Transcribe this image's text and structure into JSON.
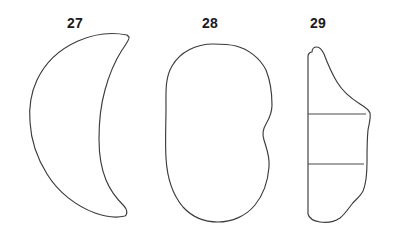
{
  "figure": {
    "type": "archaeological-artifact-line-drawing",
    "background_color": "#ffffff",
    "outline_color": "#3c3c3c",
    "label_color": "#1a1a1a",
    "width": 393,
    "height": 240
  },
  "artifacts": [
    {
      "label": "27",
      "name": "crescent-lunate-artifact",
      "description": "crescent / lunate outline, convex left edge and concave right edge meeting at pointed upper and lower tips",
      "label_x": 75,
      "label_y": 16,
      "outline_path": "M 127 35 C 112 32 94 34 78 41 C 60 49 45 63 37 80 C 30 95 29 110 30 122 C 31 140 37 158 47 174 C 58 192 76 206 95 213 C 106 217 117 218 125 216 C 128 214 127 209 124 206 C 117 199 110 190 106 180 C 101 168 99 154 99 139 C 99 122 101 104 105 90 C 109 75 115 61 122 50 C 126 44 130 39 129 37 Z",
      "cross_lines": []
    },
    {
      "label": "28",
      "name": "kidney-bean-artifact",
      "description": "kidney / bean shaped outline with an S-curve notch indenting the right margin at mid-height",
      "label_x": 210,
      "label_y": 16,
      "outline_path": "M 213 44 C 196 44 180 52 172 66 C 165 78 166 92 166 106 C 166 124 165 142 166 158 C 167 176 172 194 183 207 C 193 218 206 222 218 222 C 232 222 246 216 255 205 C 264 194 268 180 269 167 C 270 156 266 147 264 140 C 262 134 263 129 266 124 C 269 119 272 113 272 105 C 272 93 270 80 266 70 C 260 58 248 49 236 46 C 228 44 220 44 213 44 Z",
      "cross_lines": []
    },
    {
      "label": "29",
      "name": "irregular-slab-artifact",
      "description": "narrow irregular profile with straight vertical left margin, stepped right margin, and two horizontal break lines dividing it into three segments",
      "label_x": 318,
      "label_y": 16,
      "outline_path": "M 312 52 C 312 49 314 47 317 47 C 320 47 322 50 324 54 C 327 62 331 72 337 82 C 343 92 352 99 360 104 C 365 107 369 110 370 113 C 371 118 369 124 368 130 C 367 140 367 152 367 162 C 367 174 366 184 363 191 C 360 197 355 200 352 204 C 348 209 345 214 340 218 C 334 222 326 223 320 222 C 314 221 309 218 308 214 L 308 56 C 308 54 310 52 312 52 Z",
      "cross_lines": [
        {
          "name": "upper-break-line",
          "x1": 308,
          "y1": 114,
          "x2": 366,
          "y2": 114
        },
        {
          "name": "lower-break-line",
          "x1": 308,
          "y1": 164,
          "x2": 364,
          "y2": 164
        }
      ]
    }
  ]
}
